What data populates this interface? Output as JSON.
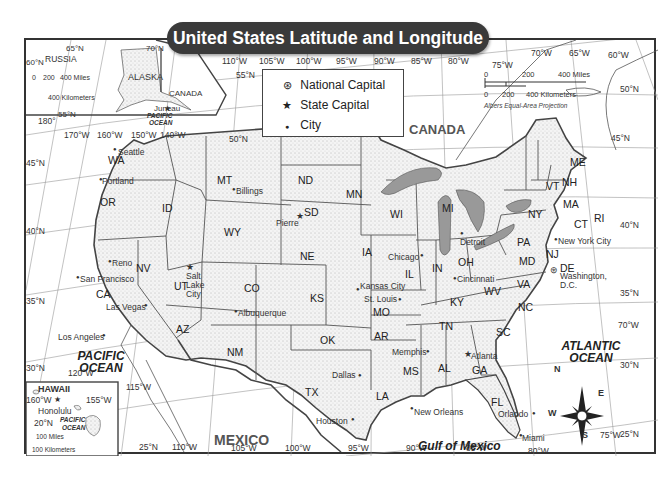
{
  "title": "United States Latitude and Longitude",
  "legend": {
    "items": [
      {
        "symbol": "circled-star",
        "label": "National Capital"
      },
      {
        "symbol": "star",
        "label": "State Capital"
      },
      {
        "symbol": "dot",
        "label": "City"
      }
    ]
  },
  "scale_main": {
    "miles": [
      "0",
      "200",
      "400 Miles"
    ],
    "km": [
      "0",
      "200",
      "400 Kilometers"
    ],
    "projection": "Albers Equal-Area Projection"
  },
  "alaska_inset": {
    "label": "ALASKA",
    "russia": "RUSSIA",
    "canada": "CANADA",
    "capital": "Juneau",
    "ocean": [
      "PACIFIC",
      "OCEAN"
    ],
    "scale_miles": [
      "0",
      "200",
      "400 Miles"
    ],
    "scale_km": "400 Kilometers",
    "lat_labels": [
      "65°N",
      "60°N",
      "55°N",
      "70°N"
    ],
    "lon_labels": [
      "180°",
      "170°W",
      "160°W",
      "150°W",
      "140°W"
    ]
  },
  "hawaii_inset": {
    "label": "HAWAII",
    "capital": "Honolulu",
    "ocean": [
      "PACIFIC",
      "OCEAN"
    ],
    "lat_labels": [
      "20°N"
    ],
    "lon_labels": [
      "160°W",
      "155°W"
    ],
    "scale_miles": "100 Miles",
    "scale_km": "100 Kilometers"
  },
  "longitude_top": [
    "110°W",
    "105°W",
    "100°W",
    "95°W",
    "90°W",
    "85°W",
    "80°W",
    "75°W",
    "70°W",
    "65°W",
    "60°W"
  ],
  "longitude_bottom": [
    "120°W",
    "115°W",
    "110°W",
    "105°W",
    "100°W",
    "95°W",
    "90°W",
    "85°W",
    "80°W",
    "75°W",
    "70°W"
  ],
  "latitude_left": [
    "55°N",
    "50°N",
    "45°N",
    "40°N",
    "35°N",
    "30°N",
    "25°N"
  ],
  "latitude_right": [
    "50°N",
    "45°N",
    "40°N",
    "35°N",
    "30°N",
    "25°N"
  ],
  "countries": [
    "CANADA",
    "MEXICO"
  ],
  "water": {
    "pacific": [
      "PACIFIC",
      "OCEAN"
    ],
    "atlantic": [
      "ATLANTIC",
      "OCEAN"
    ],
    "gulf": "Gulf of Mexico",
    "lakes": [
      "Lake Superior",
      "Lake Michigan",
      "Lake Huron",
      "Lake Erie",
      "Lake Ontario"
    ]
  },
  "states": [
    "WA",
    "OR",
    "CA",
    "ID",
    "NV",
    "UT",
    "AZ",
    "MT",
    "WY",
    "CO",
    "NM",
    "ND",
    "SD",
    "NE",
    "KS",
    "OK",
    "TX",
    "MN",
    "IA",
    "MO",
    "AR",
    "LA",
    "WI",
    "IL",
    "MI",
    "IN",
    "OH",
    "KY",
    "TN",
    "MS",
    "AL",
    "GA",
    "FL",
    "SC",
    "NC",
    "VA",
    "WV",
    "PA",
    "NY",
    "VT",
    "NH",
    "ME",
    "MA",
    "RI",
    "CT",
    "NJ",
    "DE",
    "MD"
  ],
  "cities": {
    "seattle": "Seattle",
    "portland": "Portland",
    "reno": "Reno",
    "san_francisco": "San Francisco",
    "salt_lake": [
      "Salt",
      "Lake",
      "City"
    ],
    "las_vegas": "Las Vegas",
    "los_angeles": "Los Angeles",
    "billings": "Billings",
    "pierre": "Pierre",
    "albuquerque": "Albuquerque",
    "dallas": "Dallas",
    "houston": "Houston",
    "kansas_city": "Kansas City",
    "st_louis": "St. Louis",
    "chicago": "Chicago",
    "memphis": "Memphis",
    "new_orleans": "New Orleans",
    "detroit": "Detroit",
    "cincinnati": "Cincinnati",
    "atlanta": "Atlanta",
    "orlando": "Orlando",
    "miami": "Miami",
    "new_york": "New York City",
    "washington": [
      "Washington,",
      "D.C."
    ]
  },
  "compass": [
    "N",
    "E",
    "S",
    "W"
  ]
}
